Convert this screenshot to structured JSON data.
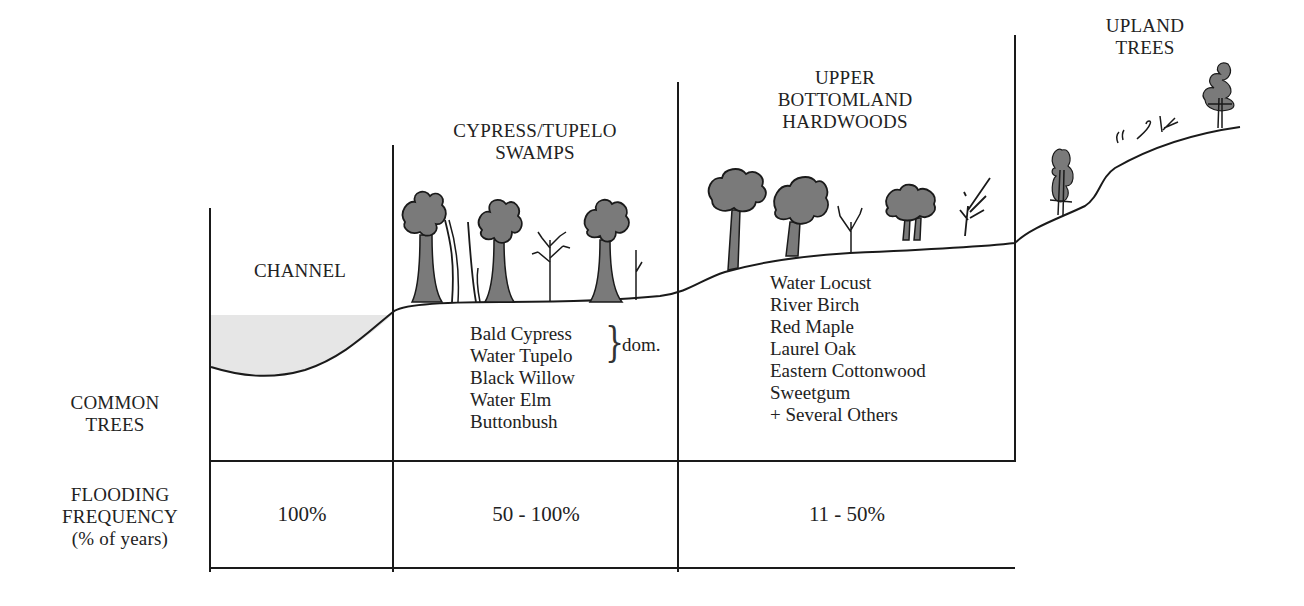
{
  "diagram": {
    "zones": [
      {
        "id": "channel",
        "title": [
          "CHANNEL"
        ],
        "trees": [],
        "flooding_frequency": "100%"
      },
      {
        "id": "cypress-tupelo",
        "title": [
          "CYPRESS/TUPELO",
          "SWAMPS"
        ],
        "trees": [
          "Bald Cypress",
          "Water Tupelo",
          "Black Willow",
          "Water Elm",
          "Buttonbush"
        ],
        "dominant_note": "dom.",
        "dominant_species": [
          "Bald Cypress",
          "Water Tupelo"
        ],
        "flooding_frequency": "50 - 100%"
      },
      {
        "id": "upper-bottomland",
        "title": [
          "UPPER",
          "BOTTOMLAND",
          "HARDWOODS"
        ],
        "trees": [
          "Water Locust",
          "River Birch",
          "Red Maple",
          "Laurel Oak",
          "Eastern Cottonwood",
          "Sweetgum",
          "+ Several Others"
        ],
        "flooding_frequency": "11 - 50%"
      },
      {
        "id": "upland",
        "title": [
          "UPLAND",
          "TREES"
        ],
        "trees": [],
        "flooding_frequency": ""
      }
    ],
    "row_labels": {
      "common_trees": [
        "COMMON",
        "TREES"
      ],
      "flooding": [
        "FLOODING",
        "FREQUENCY",
        "(% of years)"
      ]
    },
    "colors": {
      "line": "#1a1a1a",
      "tree_fill": "#7a7a7a",
      "tree_shadow": "#9a9a9a",
      "water": "#e6e6e6"
    }
  }
}
